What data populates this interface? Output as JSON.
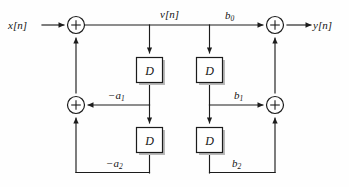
{
  "figure": {
    "type": "signal-flow-graph"
  },
  "signals": {
    "input_label": "x[n]",
    "intermediate_label": "v[n]",
    "output_label": "y[n]"
  },
  "blocks": {
    "delay_letter": "D",
    "delays": [
      {
        "id": "delay-fb-1",
        "label": "D"
      },
      {
        "id": "delay-fb-2",
        "label": "D"
      },
      {
        "id": "delay-ff-1",
        "label": "D"
      },
      {
        "id": "delay-ff-2",
        "label": "D"
      }
    ]
  },
  "adders": {
    "symbol": "+",
    "nodes": [
      {
        "id": "adder-input",
        "symbol": "+"
      },
      {
        "id": "adder-feedback",
        "symbol": "+"
      },
      {
        "id": "adder-output",
        "symbol": "+"
      },
      {
        "id": "adder-feedforward",
        "symbol": "+"
      }
    ]
  },
  "coefficients": {
    "feedback": [
      {
        "id": "coef-neg-a1",
        "base": "−a",
        "sub": "1"
      },
      {
        "id": "coef-neg-a2",
        "base": "−a",
        "sub": "2"
      }
    ],
    "feedforward": [
      {
        "id": "coef-b0",
        "base": "b",
        "sub": "0"
      },
      {
        "id": "coef-b1",
        "base": "b",
        "sub": "1"
      },
      {
        "id": "coef-b2",
        "base": "b",
        "sub": "2"
      }
    ]
  },
  "colors": {
    "line": "#1c1c1c",
    "background": "#fefefe",
    "box_fill": "#ffffff",
    "shadow": "#b9b9b9",
    "text": "#141414"
  }
}
